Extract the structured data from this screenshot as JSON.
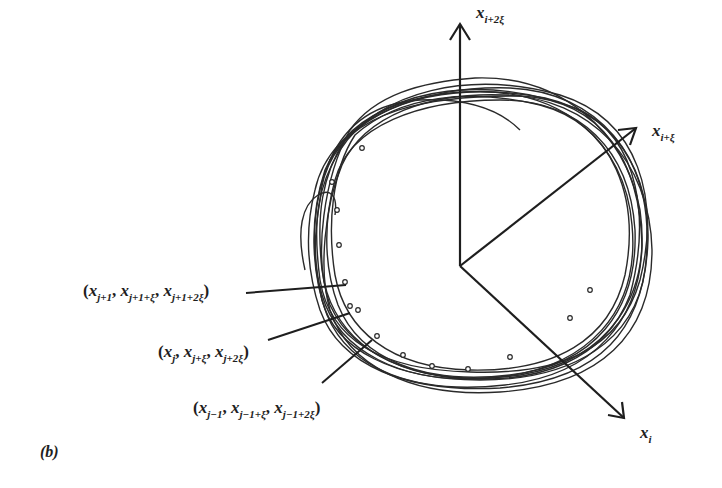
{
  "figure": {
    "panel_label": "(b)",
    "axes": {
      "vertical": {
        "var": "x",
        "sub": "i+2ξ"
      },
      "diagonal_up": {
        "var": "x",
        "sub": "i+ξ"
      },
      "diagonal_down": {
        "var": "x",
        "sub": "i"
      }
    },
    "point_labels": [
      {
        "open": "(",
        "parts": [
          {
            "var": "x",
            "sub": "j+1"
          },
          {
            "var": "x",
            "sub": "j+1+ξ"
          },
          {
            "var": "x",
            "sub": "j+1+2ξ"
          }
        ],
        "close": ")"
      },
      {
        "open": "(",
        "parts": [
          {
            "var": "x",
            "sub": "j"
          },
          {
            "var": "x",
            "sub": "j+ξ"
          },
          {
            "var": "x",
            "sub": "j+2ξ"
          }
        ],
        "close": ")"
      },
      {
        "open": "(",
        "parts": [
          {
            "var": "x",
            "sub": "j−1"
          },
          {
            "var": "x",
            "sub": "j−1+ξ"
          },
          {
            "var": "x",
            "sub": "j−1+2ξ"
          }
        ],
        "close": ")"
      }
    ],
    "colors": {
      "ink": "#1e1e1e",
      "background": "#ffffff"
    }
  }
}
